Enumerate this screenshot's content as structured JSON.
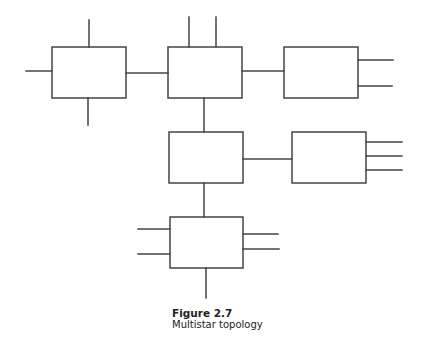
{
  "figure": {
    "number": "Figure 2.7",
    "caption": "Multistar topology"
  },
  "diagram": {
    "type": "network-topology",
    "name": "multistar",
    "stroke_color": "#444444",
    "nodes": [
      {
        "id": "hub-1",
        "x": 52,
        "y": 47,
        "w": 74,
        "h": 51,
        "stubs": [
          "top",
          "left",
          "bottom"
        ]
      },
      {
        "id": "hub-2",
        "x": 168,
        "y": 47,
        "w": 74,
        "h": 51,
        "stubs": [
          "top",
          "top"
        ]
      },
      {
        "id": "hub-3",
        "x": 284,
        "y": 47,
        "w": 74,
        "h": 51,
        "stubs": [
          "right",
          "right"
        ]
      },
      {
        "id": "hub-4",
        "x": 169,
        "y": 132,
        "w": 74,
        "h": 51,
        "stubs": []
      },
      {
        "id": "hub-5",
        "x": 292,
        "y": 132,
        "w": 74,
        "h": 51,
        "stubs": [
          "right",
          "right",
          "right"
        ]
      },
      {
        "id": "hub-6",
        "x": 170,
        "y": 217,
        "w": 73,
        "h": 51,
        "stubs": [
          "left",
          "left",
          "right",
          "right",
          "bottom"
        ]
      }
    ],
    "links": [
      [
        "hub-1",
        "hub-2"
      ],
      [
        "hub-2",
        "hub-3"
      ],
      [
        "hub-2",
        "hub-4"
      ],
      [
        "hub-4",
        "hub-5"
      ],
      [
        "hub-4",
        "hub-6"
      ]
    ]
  }
}
